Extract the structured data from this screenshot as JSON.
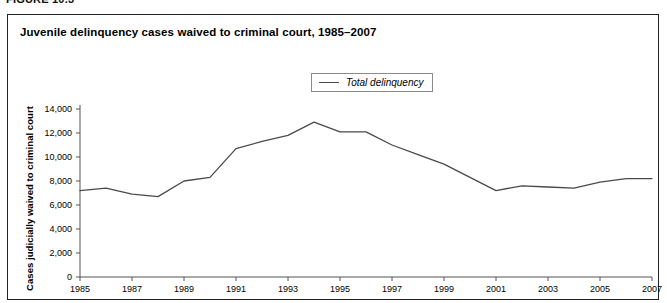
{
  "figure": {
    "number_label": "FIGURE 10.3",
    "title": "Juvenile delinquency cases waived to criminal court, 1985–2007"
  },
  "legend": {
    "position": "top-center-inside",
    "entries": [
      {
        "label": "Total delinquency",
        "color": "#4a4a4a"
      }
    ]
  },
  "axes": {
    "y_title": "Cases judicially waived to criminal court",
    "y_ticks": [
      "0",
      "2,000",
      "4,000",
      "6,000",
      "8,000",
      "10,000",
      "12,000",
      "14,000"
    ],
    "x_ticks": [
      "1985",
      "1987",
      "1989",
      "1991",
      "1993",
      "1995",
      "1997",
      "1999",
      "2001",
      "2003",
      "2005",
      "2007"
    ]
  },
  "chart_data": {
    "type": "line",
    "title": "Juvenile delinquency cases waived to criminal court, 1985–2007",
    "xlabel": "",
    "ylabel": "Cases judicially waived to criminal court",
    "xlim": [
      1985,
      2007
    ],
    "ylim": [
      0,
      14000
    ],
    "ytick_values": [
      0,
      2000,
      4000,
      6000,
      8000,
      10000,
      12000,
      14000
    ],
    "xtick_values": [
      1985,
      1987,
      1989,
      1991,
      1993,
      1995,
      1997,
      1999,
      2001,
      2003,
      2005,
      2007
    ],
    "grid": false,
    "legend": "upper center",
    "x": [
      1985,
      1986,
      1987,
      1988,
      1989,
      1990,
      1991,
      1992,
      1993,
      1994,
      1995,
      1996,
      1997,
      1998,
      1999,
      2000,
      2001,
      2002,
      2003,
      2004,
      2005,
      2006,
      2007
    ],
    "series": [
      {
        "name": "Total delinquency",
        "color": "#4a4a4a",
        "values": [
          7200,
          7400,
          6900,
          6700,
          8000,
          8300,
          10700,
          11300,
          11800,
          12900,
          12100,
          12100,
          11000,
          10200,
          9400,
          8300,
          7200,
          7600,
          7500,
          7400,
          7900,
          8200,
          8200
        ]
      }
    ]
  }
}
